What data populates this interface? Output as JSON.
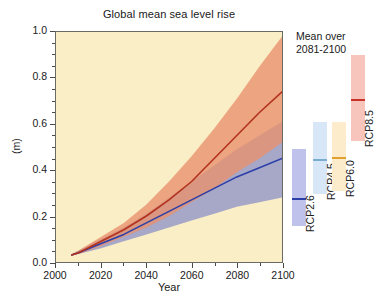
{
  "chart_data": {
    "type": "line",
    "title": "Global mean sea level rise",
    "xlabel": "Year",
    "ylabel": "(m)",
    "xlim": [
      2000,
      2100
    ],
    "ylim": [
      0.0,
      1.0
    ],
    "xticks": [
      "2000",
      "2020",
      "2040",
      "2060",
      "2080",
      "2100"
    ],
    "xtick_values": [
      2000,
      2020,
      2040,
      2060,
      2080,
      2100
    ],
    "yticks": [
      "0.0",
      "0.2",
      "0.4",
      "0.6",
      "0.8",
      "1.0"
    ],
    "ytick_values": [
      0.0,
      0.2,
      0.4,
      0.6,
      0.8,
      1.0
    ],
    "minor_tick_interval_x": 10,
    "minor_tick_interval_y": 0.05,
    "grid": false,
    "background_color": "#faeec6",
    "series": [
      {
        "name": "RCP2.6",
        "color": "#2c3fa8",
        "band_color": "#8f93c8",
        "x": [
          2007,
          2010,
          2020,
          2030,
          2040,
          2050,
          2060,
          2070,
          2080,
          2090,
          2100
        ],
        "values": [
          0.03,
          0.04,
          0.08,
          0.12,
          0.17,
          0.22,
          0.27,
          0.32,
          0.37,
          0.41,
          0.45
        ],
        "band_low": [
          0.03,
          0.035,
          0.06,
          0.09,
          0.12,
          0.15,
          0.18,
          0.21,
          0.24,
          0.26,
          0.28
        ],
        "band_high": [
          0.035,
          0.05,
          0.1,
          0.15,
          0.21,
          0.28,
          0.35,
          0.42,
          0.49,
          0.55,
          0.61
        ]
      },
      {
        "name": "RCP8.5",
        "color": "#b3321e",
        "band_color": "#e8916b",
        "x": [
          2007,
          2010,
          2020,
          2030,
          2040,
          2050,
          2060,
          2070,
          2080,
          2090,
          2100
        ],
        "values": [
          0.03,
          0.04,
          0.09,
          0.14,
          0.2,
          0.27,
          0.35,
          0.45,
          0.55,
          0.65,
          0.74
        ],
        "band_low": [
          0.03,
          0.035,
          0.07,
          0.11,
          0.15,
          0.2,
          0.26,
          0.32,
          0.39,
          0.45,
          0.52
        ],
        "band_high": [
          0.035,
          0.05,
          0.11,
          0.17,
          0.25,
          0.35,
          0.46,
          0.58,
          0.71,
          0.85,
          0.98
        ]
      }
    ],
    "legend_title": "Mean over 2081-2100",
    "legend_bars": [
      {
        "name": "RCP2.6",
        "low": 0.28,
        "high": 0.61,
        "median": 0.4,
        "box_color": "#bfc3ec",
        "median_color": "#2c3fa8"
      },
      {
        "name": "RCP4.5",
        "low": 0.32,
        "high": 0.63,
        "median": 0.47,
        "box_color": "#d8e7f7",
        "median_color": "#7aadd4"
      },
      {
        "name": "RCP6.0",
        "low": 0.33,
        "high": 0.63,
        "median": 0.48,
        "box_color": "#fdeccb",
        "median_color": "#e0a12e"
      },
      {
        "name": "RCP8.5",
        "low": 0.45,
        "high": 0.82,
        "median": 0.63,
        "box_color": "#f8c5bd",
        "median_color": "#c8342a"
      }
    ]
  },
  "chart": {
    "title": "Global mean sea level rise",
    "y_axis_name": "(m)",
    "x_axis_name": "Year"
  },
  "legend": {
    "line1": "Mean over",
    "line2": "2081-2100"
  }
}
